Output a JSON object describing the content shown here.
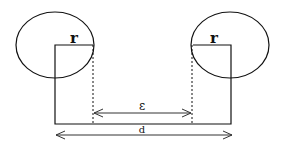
{
  "diagram": {
    "type": "geometry-schematic",
    "labels": {
      "left_radius": "r",
      "right_radius": "r",
      "gap": "ε",
      "distance": "d"
    },
    "colors": {
      "stroke": "#111111",
      "arrow": "#333333",
      "background": "#ffffff"
    },
    "left_shape": {
      "ellipse": {
        "cx": 55,
        "cy": 45,
        "rx": 39,
        "ry": 33
      },
      "rect": {
        "x": 55,
        "y": 45,
        "w": 38,
        "h": 79
      }
    },
    "right_shape": {
      "ellipse": {
        "cx": 230,
        "cy": 45,
        "rx": 39,
        "ry": 33
      },
      "rect": {
        "x": 193,
        "y": 45,
        "w": 38,
        "h": 79
      }
    },
    "gap_arrow": {
      "x1": 93,
      "x2": 192,
      "y": 113
    },
    "distance_arrow": {
      "x1": 55,
      "x2": 232,
      "y": 135
    }
  }
}
